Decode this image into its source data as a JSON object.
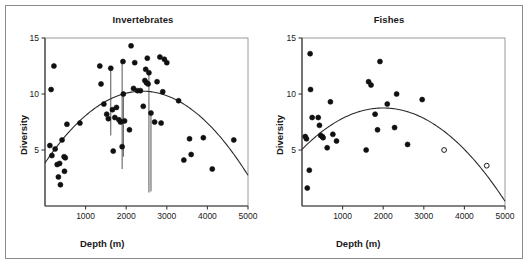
{
  "figure": {
    "name": "depth-diversity-scatter-figure",
    "background": "#ffffff",
    "border_color": "#8a8a8a"
  },
  "chart_data": [
    {
      "type": "scatter",
      "name": "invertebrates",
      "title": "Invertebrates",
      "xlabel": "Depth (m)",
      "ylabel": "Diversity",
      "xlim": [
        0,
        5000
      ],
      "ylim": [
        0,
        15
      ],
      "xticks": [
        1000,
        2000,
        3000,
        4000,
        5000
      ],
      "yticks": [
        5,
        10,
        15
      ],
      "grid": false,
      "legend": "none",
      "marker": "filled-circle",
      "marker_color": "#101010",
      "points": [
        {
          "x": 120,
          "y": 5.4
        },
        {
          "x": 150,
          "y": 10.4
        },
        {
          "x": 170,
          "y": 4.5
        },
        {
          "x": 220,
          "y": 12.5
        },
        {
          "x": 250,
          "y": 5.1
        },
        {
          "x": 300,
          "y": 3.7
        },
        {
          "x": 330,
          "y": 2.6
        },
        {
          "x": 360,
          "y": 3.8
        },
        {
          "x": 380,
          "y": 1.9
        },
        {
          "x": 420,
          "y": 5.9
        },
        {
          "x": 470,
          "y": 4.4
        },
        {
          "x": 480,
          "y": 3.1
        },
        {
          "x": 500,
          "y": 4.3
        },
        {
          "x": 540,
          "y": 7.3
        },
        {
          "x": 860,
          "y": 7.4
        },
        {
          "x": 1350,
          "y": 12.5
        },
        {
          "x": 1380,
          "y": 10.9
        },
        {
          "x": 1450,
          "y": 9.1
        },
        {
          "x": 1520,
          "y": 8.2
        },
        {
          "x": 1560,
          "y": 7.8
        },
        {
          "x": 1620,
          "y": 12.3
        },
        {
          "x": 1660,
          "y": 8.6
        },
        {
          "x": 1680,
          "y": 4.9
        },
        {
          "x": 1720,
          "y": 7.9
        },
        {
          "x": 1760,
          "y": 8.8
        },
        {
          "x": 1820,
          "y": 7.7
        },
        {
          "x": 1860,
          "y": 7.5
        },
        {
          "x": 1900,
          "y": 5.3
        },
        {
          "x": 1920,
          "y": 12.9
        },
        {
          "x": 1930,
          "y": 10.0
        },
        {
          "x": 1960,
          "y": 7.6
        },
        {
          "x": 2080,
          "y": 6.8
        },
        {
          "x": 2120,
          "y": 14.3
        },
        {
          "x": 2180,
          "y": 10.5
        },
        {
          "x": 2210,
          "y": 12.8
        },
        {
          "x": 2280,
          "y": 10.3
        },
        {
          "x": 2350,
          "y": 10.3
        },
        {
          "x": 2420,
          "y": 8.9
        },
        {
          "x": 2460,
          "y": 11.2
        },
        {
          "x": 2480,
          "y": 12.2
        },
        {
          "x": 2500,
          "y": 11.0
        },
        {
          "x": 2520,
          "y": 13.2
        },
        {
          "x": 2540,
          "y": 10.9
        },
        {
          "x": 2560,
          "y": 11.9
        },
        {
          "x": 2610,
          "y": 8.3
        },
        {
          "x": 2700,
          "y": 7.5
        },
        {
          "x": 2760,
          "y": 11.1
        },
        {
          "x": 2830,
          "y": 13.3
        },
        {
          "x": 2860,
          "y": 7.4
        },
        {
          "x": 2900,
          "y": 10.2
        },
        {
          "x": 2940,
          "y": 13.1
        },
        {
          "x": 3000,
          "y": 12.8
        },
        {
          "x": 3290,
          "y": 9.4
        },
        {
          "x": 3420,
          "y": 4.1
        },
        {
          "x": 3560,
          "y": 6.0
        },
        {
          "x": 3600,
          "y": 4.6
        },
        {
          "x": 3900,
          "y": 6.1
        },
        {
          "x": 4120,
          "y": 3.3
        },
        {
          "x": 4650,
          "y": 5.9
        }
      ],
      "droplines": [
        {
          "x": 1620,
          "y_top": 12.3,
          "y_bottom": 6.3
        },
        {
          "x": 1900,
          "y_top": 12.9,
          "y_bottom": 3.3
        },
        {
          "x": 1930,
          "y_top": 10.0,
          "y_bottom": 4.4
        },
        {
          "x": 2560,
          "y_top": 11.9,
          "y_bottom": 1.2
        },
        {
          "x": 2610,
          "y_top": 8.3,
          "y_bottom": 1.3
        }
      ],
      "fit_curve": {
        "kind": "quadratic",
        "description": "hump-shaped quadratic fit peaking near 2400 m",
        "vertex_x": 2400,
        "vertex_y": 10.25,
        "y_at_x0": 3.85,
        "y_at_x5000": 2.55
      }
    },
    {
      "type": "scatter",
      "name": "fishes",
      "title": "Fishes",
      "xlabel": "Depth (m)",
      "ylabel": "Diversity",
      "xlim": [
        0,
        5000
      ],
      "ylim": [
        0,
        15
      ],
      "xticks": [
        1000,
        2000,
        3000,
        4000,
        5000
      ],
      "yticks": [
        5,
        10,
        15
      ],
      "grid": false,
      "legend": "none",
      "marker": "filled-circle",
      "marker_color": "#101010",
      "points": [
        {
          "x": 80,
          "y": 6.2,
          "filled": true
        },
        {
          "x": 110,
          "y": 6.0,
          "filled": true
        },
        {
          "x": 130,
          "y": 1.6,
          "filled": true
        },
        {
          "x": 180,
          "y": 3.2,
          "filled": true
        },
        {
          "x": 200,
          "y": 13.6,
          "filled": true
        },
        {
          "x": 210,
          "y": 10.4,
          "filled": true
        },
        {
          "x": 250,
          "y": 7.9,
          "filled": true
        },
        {
          "x": 400,
          "y": 7.9,
          "filled": true
        },
        {
          "x": 430,
          "y": 7.2,
          "filled": true
        },
        {
          "x": 460,
          "y": 6.3,
          "filled": true
        },
        {
          "x": 500,
          "y": 6.2,
          "filled": true
        },
        {
          "x": 520,
          "y": 6.1,
          "filled": true
        },
        {
          "x": 620,
          "y": 5.2,
          "filled": true
        },
        {
          "x": 700,
          "y": 9.3,
          "filled": true
        },
        {
          "x": 760,
          "y": 6.4,
          "filled": true
        },
        {
          "x": 850,
          "y": 5.8,
          "filled": true
        },
        {
          "x": 1580,
          "y": 5.0,
          "filled": true
        },
        {
          "x": 1640,
          "y": 11.1,
          "filled": true
        },
        {
          "x": 1700,
          "y": 10.8,
          "filled": true
        },
        {
          "x": 1800,
          "y": 8.2,
          "filled": true
        },
        {
          "x": 1860,
          "y": 6.8,
          "filled": true
        },
        {
          "x": 1920,
          "y": 12.9,
          "filled": true
        },
        {
          "x": 2100,
          "y": 9.1,
          "filled": true
        },
        {
          "x": 2280,
          "y": 7.0,
          "filled": true
        },
        {
          "x": 2330,
          "y": 10.0,
          "filled": true
        },
        {
          "x": 2600,
          "y": 5.5,
          "filled": true
        },
        {
          "x": 2960,
          "y": 9.5,
          "filled": true
        },
        {
          "x": 3500,
          "y": 5.0,
          "filled": false
        },
        {
          "x": 4550,
          "y": 3.6,
          "filled": false
        }
      ],
      "open_marker_note": "two open (unfilled) circles at deepest stations",
      "fit_curve": {
        "kind": "quadratic",
        "description": "hump-shaped quadratic fit peaking near 2000 m",
        "vertex_x": 2000,
        "vertex_y": 8.75,
        "y_at_x0": 5.05,
        "y_at_x5000": 1.8
      }
    }
  ]
}
